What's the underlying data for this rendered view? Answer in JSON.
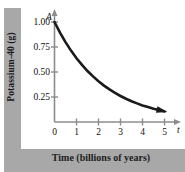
{
  "chart_data": {
    "type": "line",
    "title": "",
    "xlabel": "Time (billions of years)",
    "ylabel": "Potassium-40 (g)",
    "x_axis_variable": "t",
    "y_axis_variable": "A",
    "xlim": [
      0,
      5.6
    ],
    "ylim": [
      0,
      1.12
    ],
    "grid": false,
    "legend": null,
    "x_ticks": [
      "0",
      "1",
      "2",
      "3",
      "4",
      "5"
    ],
    "x_tick_values": [
      0,
      1,
      2,
      3,
      4,
      5
    ],
    "y_ticks": [
      "0.25",
      "0.50",
      "0.75",
      "1.00"
    ],
    "y_tick_values": [
      0.25,
      0.5,
      0.75,
      1.0
    ],
    "series": [
      {
        "name": "Potassium-40 remaining",
        "arrow_end": true,
        "x": [
          0,
          0.25,
          0.5,
          0.75,
          1,
          1.25,
          1.5,
          1.75,
          2,
          2.25,
          2.5,
          2.75,
          3,
          3.25,
          3.5,
          3.75,
          4,
          4.25,
          4.5,
          4.75,
          5
        ],
        "values": [
          1.0,
          0.894,
          0.799,
          0.714,
          0.638,
          0.571,
          0.51,
          0.456,
          0.408,
          0.364,
          0.326,
          0.291,
          0.26,
          0.233,
          0.208,
          0.186,
          0.166,
          0.149,
          0.133,
          0.119,
          0.106
        ]
      }
    ]
  },
  "colors": {
    "band": "#a8a8a8",
    "curve": "#1a1a1a",
    "axis": "#8c8c8c",
    "text": "#111111",
    "background": "#ffffff"
  }
}
